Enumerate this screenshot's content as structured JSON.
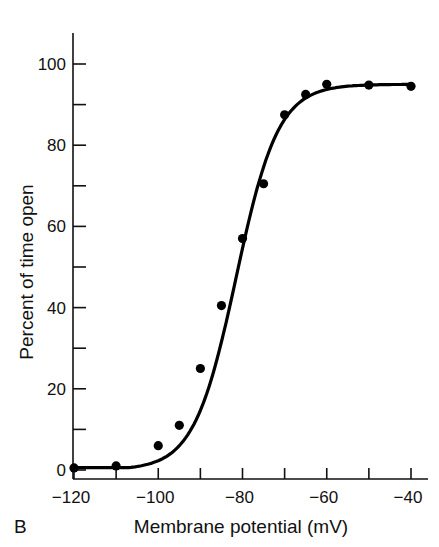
{
  "chart_data": {
    "type": "scatter",
    "panel_label": "B",
    "title": "",
    "xlabel": "Membrane potential (mV)",
    "ylabel": "Percent of time open",
    "xlim": [
      -120,
      -36
    ],
    "ylim": [
      0,
      108
    ],
    "x_ticks": [
      -120,
      -110,
      -100,
      -90,
      -80,
      -70,
      -60,
      -50,
      -40
    ],
    "x_tick_labels": [
      "−120",
      "−100",
      "−80",
      "−60",
      "−40"
    ],
    "x_tick_label_values": [
      -120,
      -100,
      -80,
      -60,
      -40
    ],
    "y_ticks": [
      0,
      10,
      20,
      30,
      40,
      50,
      60,
      70,
      80,
      90,
      100
    ],
    "y_tick_labels": [
      "0",
      "20",
      "40",
      "60",
      "80",
      "100"
    ],
    "y_tick_label_values": [
      0,
      20,
      40,
      60,
      80,
      100
    ],
    "grid": false,
    "legend": null,
    "series": [
      {
        "name": "Measured",
        "kind": "points",
        "x": [
          -120,
          -110,
          -100,
          -95,
          -90,
          -85,
          -80,
          -75,
          -70,
          -65,
          -60,
          -50,
          -40
        ],
        "y": [
          0.5,
          1,
          6,
          11,
          25,
          40.5,
          57,
          70.5,
          87.5,
          92.5,
          95,
          94.8,
          94.5
        ]
      },
      {
        "name": "Boltzmann fit",
        "kind": "curve",
        "max": 95,
        "v_half": -81.5,
        "slope": 5.0
      }
    ]
  }
}
